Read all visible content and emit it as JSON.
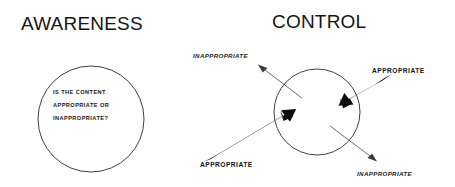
{
  "panels": [
    {
      "id": "awareness",
      "title": "AWARENESS",
      "circle_lines": [
        "IS THE CONTENT",
        "APPROPRIATE OR",
        "INAPPROPRIATE?"
      ]
    },
    {
      "id": "control",
      "title": "CONTROL",
      "labels": {
        "top_left": "INAPPROPRIATE",
        "top_right": "APPROPRIATE",
        "bottom_left": "APPROPRIATE",
        "bottom_right": "INAPPROPRIATE"
      }
    }
  ],
  "colors": {
    "background": "#ffffff",
    "ink": "#151515",
    "circle_stroke": "#2a2a2a",
    "bold_arrow": "#0d0d0d",
    "thin_arrow": "#3a3a3a"
  },
  "icons": {
    "bold_arrow_in": "thick-arrow-inward-icon",
    "thin_arrow_out": "thin-arrow-outward-icon"
  }
}
